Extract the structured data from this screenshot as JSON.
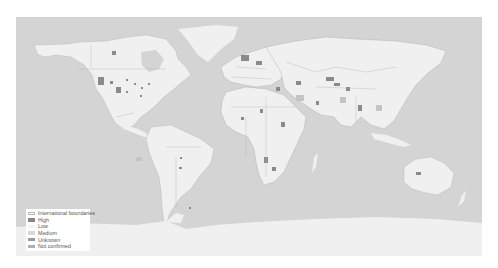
{
  "map": {
    "ocean_color": "#d4d4d4",
    "land_color": "#f0f0f0",
    "border_color": "#a8a8a8",
    "high_color": "#8a8a8a"
  },
  "legend": {
    "items": [
      {
        "label": "International boundaries",
        "color": "#ffffff",
        "border": "#bbbbbb"
      },
      {
        "label": "High",
        "color": "#888888",
        "border": "#888888"
      },
      {
        "label": "Low",
        "color": "#f4f4f4",
        "border": "#f4f4f4"
      },
      {
        "label": "Medium",
        "color": "#d8d8d8",
        "border": "#d8d8d8"
      },
      {
        "label": "Unknown",
        "color": "#9a9a9a",
        "border": "#9a9a9a"
      },
      {
        "label": "Not confirmed",
        "color": "#b0b0b0",
        "border": "#b0b0b0"
      }
    ]
  }
}
